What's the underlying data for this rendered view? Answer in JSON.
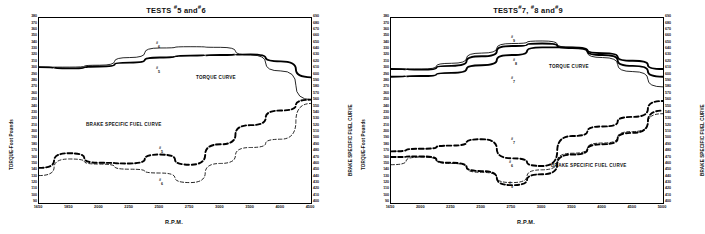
{
  "figure": {
    "xlabel": "R.P.M.",
    "y_left_title": "TORQUE-Foot Pounds",
    "y_right_title": "BRAKE SPECIFIC FUEL CURVE"
  },
  "panels": [
    {
      "title": "TESTS #5 and#6",
      "title_parts": {
        "lead": "TESTS",
        "a": "5",
        "mid": "and",
        "b": "6"
      },
      "annotations": {
        "torque": "TORQUE CURVE",
        "fuel": "BRAKE SPECIFIC FUEL CURVE"
      },
      "series_labels": [
        {
          "name": "6",
          "kind": "torque"
        },
        {
          "name": "5",
          "kind": "torque"
        },
        {
          "name": "5",
          "kind": "fuel"
        },
        {
          "name": "6",
          "kind": "fuel"
        }
      ]
    },
    {
      "title": "TESTS #7, #8 and #9",
      "title_parts": {
        "lead": "TESTS",
        "a": "7,",
        "a2": "8",
        "mid": "and",
        "b": "9"
      },
      "annotations": {
        "torque": "TORQUE CURVE",
        "fuel": "BRAKE SPECIFIC FUEL CURVE"
      },
      "series_labels": [
        {
          "name": "9",
          "kind": "torque"
        },
        {
          "name": "8",
          "kind": "torque"
        },
        {
          "name": "7",
          "kind": "torque"
        },
        {
          "name": "7",
          "kind": "fuel"
        },
        {
          "name": "6",
          "kind": "fuel"
        },
        {
          "name": "9",
          "kind": "fuel"
        }
      ]
    }
  ],
  "chart_data": [
    {
      "type": "line",
      "title": "TESTS #5 and #6",
      "xlabel": "R.P.M.",
      "ylabel": "TORQUE-Foot Pounds",
      "ylabel_right": "BRAKE SPECIFIC FUEL CURVE",
      "grid": false,
      "legend": "inline-annotation",
      "xlim": [
        1650,
        4500
      ],
      "xticks": [
        1650,
        1850,
        2000,
        2250,
        2500,
        2750,
        3000,
        3500,
        4000,
        4500
      ],
      "ylim_left": [
        90,
        380
      ],
      "yticks_left": [
        90,
        100,
        110,
        120,
        130,
        140,
        150,
        160,
        170,
        180,
        190,
        200,
        210,
        220,
        230,
        240,
        250,
        260,
        270,
        280,
        290,
        300,
        310,
        320,
        330,
        340,
        350,
        360,
        370,
        380
      ],
      "ylim_right": [
        400,
        690
      ],
      "yticks_right": [
        400,
        410,
        420,
        430,
        440,
        450,
        460,
        470,
        480,
        490,
        500,
        510,
        520,
        530,
        540,
        550,
        560,
        570,
        580,
        590,
        600,
        610,
        620,
        630,
        640,
        650,
        660,
        670,
        680,
        690
      ],
      "series": [
        {
          "name": "#5 torque",
          "axis": "left",
          "style": "solid-bold",
          "x": [
            1650,
            1850,
            2000,
            2250,
            2500,
            2750,
            3000,
            3500,
            4000,
            4500
          ],
          "values": [
            303,
            301,
            304,
            310,
            318,
            321,
            322,
            323,
            312,
            287
          ]
        },
        {
          "name": "#6 torque",
          "axis": "left",
          "style": "solid-thin",
          "x": [
            1650,
            1850,
            2000,
            2250,
            2500,
            2750,
            3000,
            3500,
            4000,
            4500
          ],
          "values": [
            303,
            303,
            306,
            318,
            333,
            335,
            334,
            322,
            297,
            252
          ]
        },
        {
          "name": "#5 fuel",
          "axis": "right",
          "style": "dashed-bold",
          "x": [
            1650,
            1850,
            2000,
            2250,
            2500,
            2750,
            3000,
            3500,
            4000,
            4500
          ],
          "values": [
            455,
            478,
            463,
            462,
            476,
            460,
            492,
            522,
            545,
            562
          ]
        },
        {
          "name": "#6 fuel",
          "axis": "right",
          "style": "dashed-thin",
          "x": [
            1650,
            1850,
            2000,
            2250,
            2500,
            2750,
            3000,
            3500,
            4000,
            4500
          ],
          "values": [
            443,
            469,
            461,
            453,
            447,
            432,
            462,
            487,
            500,
            556
          ]
        }
      ]
    },
    {
      "type": "line",
      "title": "TESTS #7, #8 and #9",
      "xlabel": "R.P.M.",
      "ylabel": "TORQUE-Foot Pounds",
      "ylabel_right": "BRAKE SPECIFIC FUEL CURVE",
      "grid": false,
      "legend": "inline-annotation",
      "xlim": [
        1650,
        5000
      ],
      "xticks": [
        1650,
        2000,
        2250,
        2500,
        2750,
        3000,
        3500,
        4000,
        4500,
        5000
      ],
      "ylim_left": [
        90,
        380
      ],
      "yticks_left": [
        90,
        100,
        110,
        120,
        130,
        140,
        150,
        160,
        170,
        180,
        190,
        200,
        210,
        220,
        230,
        240,
        250,
        260,
        270,
        280,
        290,
        300,
        310,
        320,
        330,
        340,
        350,
        360,
        370,
        380
      ],
      "ylim_right": [
        400,
        690
      ],
      "yticks_right": [
        400,
        410,
        420,
        430,
        440,
        450,
        460,
        470,
        480,
        490,
        500,
        510,
        520,
        530,
        540,
        550,
        560,
        570,
        580,
        590,
        600,
        610,
        620,
        630,
        640,
        650,
        660,
        670,
        680,
        690
      ],
      "series": [
        {
          "name": "#7 torque",
          "axis": "left",
          "style": "solid-bold",
          "x": [
            1650,
            2000,
            2250,
            2500,
            2750,
            3000,
            3500,
            4000,
            4500,
            5000
          ],
          "values": [
            300,
            299,
            305,
            320,
            336,
            340,
            333,
            322,
            305,
            288
          ]
        },
        {
          "name": "#8 torque",
          "axis": "left",
          "style": "solid-thin",
          "x": [
            1650,
            2000,
            2250,
            2500,
            2750,
            3000,
            3500,
            4000,
            4500,
            5000
          ],
          "values": [
            300,
            300,
            309,
            325,
            340,
            344,
            334,
            318,
            296,
            272
          ]
        },
        {
          "name": "#9 torque",
          "axis": "left",
          "style": "solid-bold",
          "x": [
            1650,
            2000,
            2250,
            2500,
            2750,
            3000,
            3500,
            4000,
            4500,
            5000
          ],
          "values": [
            288,
            289,
            294,
            306,
            322,
            334,
            334,
            325,
            313,
            300
          ]
        },
        {
          "name": "#7 fuel",
          "axis": "right",
          "style": "dashed-bold",
          "x": [
            1650,
            2000,
            2250,
            2500,
            2750,
            3000,
            3500,
            4000,
            4500,
            5000
          ],
          "values": [
            481,
            485,
            490,
            500,
            470,
            458,
            505,
            520,
            535,
            560
          ]
        },
        {
          "name": "#6 fuel",
          "axis": "right",
          "style": "dashed-thin",
          "x": [
            1650,
            2000,
            2250,
            2500,
            2750,
            3000,
            3500,
            4000,
            4500,
            5000
          ],
          "values": [
            460,
            472,
            462,
            448,
            432,
            452,
            478,
            494,
            512,
            540
          ]
        },
        {
          "name": "#9 fuel",
          "axis": "right",
          "style": "dashed-bold",
          "x": [
            1650,
            2000,
            2250,
            2500,
            2750,
            3000,
            3500,
            4000,
            4500,
            5000
          ],
          "values": [
            472,
            473,
            463,
            450,
            428,
            445,
            476,
            492,
            510,
            545
          ]
        }
      ]
    }
  ]
}
